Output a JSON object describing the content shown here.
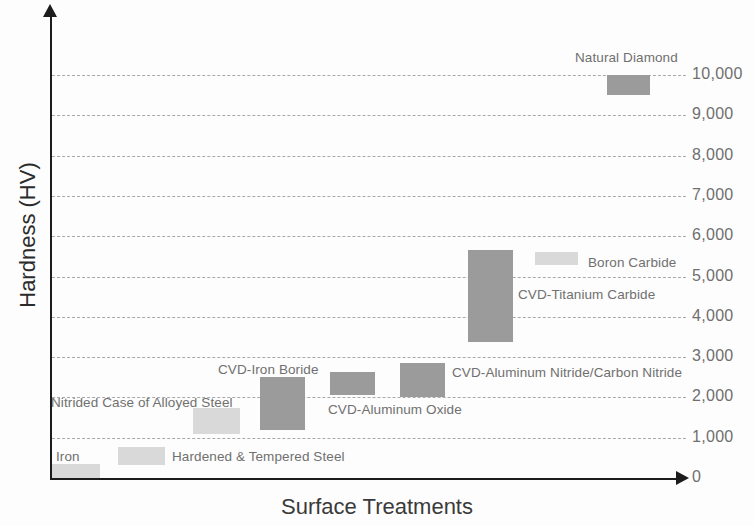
{
  "chart_data": {
    "type": "bar",
    "title": "",
    "xlabel": "Surface Treatments",
    "ylabel": "Hardness (HV)",
    "ylim": [
      0,
      10500
    ],
    "y_ticks": [
      0,
      1000,
      2000,
      3000,
      4000,
      5000,
      6000,
      7000,
      8000,
      9000,
      10000
    ],
    "y_tick_labels": [
      "0",
      "1,000",
      "2,000",
      "3,000",
      "4,000",
      "5,000",
      "6,000",
      "7,000",
      "8,000",
      "9,000",
      "10,000"
    ],
    "grid": true,
    "grid_style": "dashed-horizontal",
    "legend": "none",
    "bar_style": "floating range bars (low-high), ordered left to right by increasing hardness",
    "categories": [
      "Iron",
      "Hardened & Tempered Steel",
      "Nitrided Case of Alloyed Steel",
      "CVD-Iron Boride",
      "CVD-Aluminum Oxide",
      "CVD-Aluminum Nitride/Carbon Nitride",
      "CVD-Titanium Carbide",
      "Boron Carbide",
      "Natural Diamond"
    ],
    "series": [
      {
        "name": "Hardness range (HV)",
        "low": [
          0,
          330,
          1100,
          1200,
          2050,
          2000,
          3370,
          5280,
          9500
        ],
        "high": [
          350,
          780,
          1750,
          2500,
          2630,
          2850,
          5660,
          5600,
          10000
        ]
      }
    ],
    "bars": [
      {
        "label": "Iron",
        "low": 0,
        "high": 350,
        "shade": "light",
        "x": 52,
        "w": 48,
        "y": 464,
        "h": 14,
        "label_x": 56,
        "label_y": 449,
        "label_anchor": "left"
      },
      {
        "label": "Hardened & Tempered Steel",
        "low": 330,
        "high": 780,
        "shade": "light",
        "x": 118,
        "w": 47,
        "y": 447,
        "h": 18,
        "label_x": 172,
        "label_y": 449,
        "label_anchor": "left"
      },
      {
        "label": "Nitrided Case of Alloyed Steel",
        "low": 1100,
        "high": 1750,
        "shade": "light",
        "x": 193,
        "w": 47,
        "y": 408,
        "h": 26,
        "label_x": 51,
        "label_y": 395,
        "label_anchor": "left"
      },
      {
        "label": "CVD-Iron Boride",
        "low": 1200,
        "high": 2500,
        "shade": "dark",
        "x": 260,
        "w": 45,
        "y": 377,
        "h": 53,
        "label_x": 218,
        "label_y": 362,
        "label_anchor": "left"
      },
      {
        "label": "CVD-Aluminum Oxide",
        "low": 2050,
        "high": 2630,
        "shade": "dark",
        "x": 330,
        "w": 45,
        "y": 372,
        "h": 23,
        "label_x": 328,
        "label_y": 402,
        "label_anchor": "left"
      },
      {
        "label": "CVD-Aluminum Nitride/Carbon Nitride",
        "low": 2000,
        "high": 2850,
        "shade": "dark",
        "x": 400,
        "w": 45,
        "y": 363,
        "h": 34,
        "label_x": 452,
        "label_y": 365,
        "label_anchor": "left"
      },
      {
        "label": "CVD-Titanium Carbide",
        "low": 3370,
        "high": 5660,
        "shade": "dark",
        "x": 468,
        "w": 45,
        "y": 250,
        "h": 92,
        "label_x": 518,
        "label_y": 287,
        "label_anchor": "left"
      },
      {
        "label": "Boron Carbide",
        "low": 5280,
        "high": 5600,
        "shade": "light",
        "x": 535,
        "w": 43,
        "y": 252,
        "h": 13,
        "label_x": 588,
        "label_y": 255,
        "label_anchor": "left"
      },
      {
        "label": "Natural Diamond",
        "low": 9500,
        "high": 10000,
        "shade": "dark",
        "x": 607,
        "w": 43,
        "y": 75,
        "h": 20,
        "label_x": 575,
        "label_y": 50,
        "label_anchor": "left"
      }
    ]
  },
  "colors": {
    "bar_dark": "#9b9b9b",
    "bar_light": "#d9d9d9",
    "gridline": "#9b9b9b",
    "axis": "#1c1c1c",
    "tick_text": "#6f6f6f",
    "series_text": "#70706f",
    "axis_title": "#2b2b2b",
    "background": "#fdfdfd"
  }
}
